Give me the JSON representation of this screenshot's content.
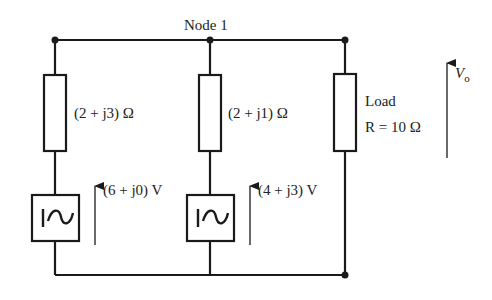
{
  "diagram": {
    "type": "circuit",
    "node_label": "Node 1",
    "branches": [
      {
        "id": "branch-1",
        "impedance_label": "(2 + j3) Ω",
        "source_label": "(6 + j0) V",
        "source_symbol": "ac-voltage-source"
      },
      {
        "id": "branch-2",
        "impedance_label": "(2 + j1) Ω",
        "source_label": "(4 + j3) V",
        "source_symbol": "ac-voltage-source"
      },
      {
        "id": "load",
        "load_title": "Load",
        "load_value": "R = 10 Ω"
      }
    ],
    "output_voltage": {
      "symbol": "V",
      "subscript": "o"
    },
    "colors": {
      "line": "#1a1a1a",
      "text": "#222222",
      "background": "#ffffff"
    }
  }
}
